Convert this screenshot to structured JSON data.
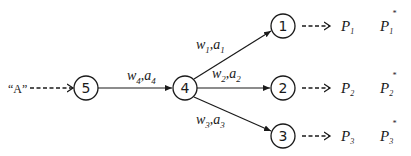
{
  "diagram": {
    "type": "network-graph",
    "stroke_color": "#1a1a1a",
    "background": "#ffffff",
    "input_label": "“A”",
    "nodes": [
      {
        "id": "5",
        "label": "5",
        "cx": 86,
        "cy": 88
      },
      {
        "id": "4",
        "label": "4",
        "cx": 185,
        "cy": 88
      },
      {
        "id": "1",
        "label": "1",
        "cx": 283,
        "cy": 26
      },
      {
        "id": "2",
        "label": "2",
        "cx": 283,
        "cy": 88
      },
      {
        "id": "3",
        "label": "3",
        "cx": 283,
        "cy": 136
      }
    ],
    "edges": [
      {
        "from": "5",
        "to": "4",
        "w": "w",
        "w_sub": "4",
        "a": "a",
        "a_sub": "4"
      },
      {
        "from": "4",
        "to": "1",
        "w": "w",
        "w_sub": "1",
        "a": "a",
        "a_sub": "1"
      },
      {
        "from": "4",
        "to": "2",
        "w": "w",
        "w_sub": "2",
        "a": "a",
        "a_sub": "2"
      },
      {
        "from": "4",
        "to": "3",
        "w": "w",
        "w_sub": "3",
        "a": "a",
        "a_sub": "3"
      }
    ],
    "outputs": [
      {
        "node": "1",
        "p": "P",
        "p_sub": "1",
        "pstar": "P",
        "pstar_sub": "1",
        "star": "*"
      },
      {
        "node": "2",
        "p": "P",
        "p_sub": "2",
        "pstar": "P",
        "pstar_sub": "2",
        "star": "*"
      },
      {
        "node": "3",
        "p": "P",
        "p_sub": "3",
        "pstar": "P",
        "pstar_sub": "3",
        "star": "*"
      }
    ],
    "separator": ","
  }
}
